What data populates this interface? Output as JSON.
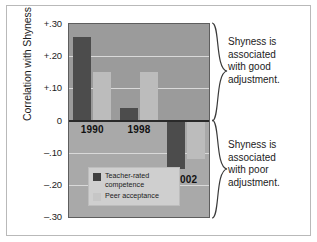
{
  "chart_data": {
    "type": "bar",
    "title": "",
    "xlabel": "",
    "ylabel": "Correlation with Shyness",
    "ylim": [
      -0.3,
      0.3
    ],
    "grid": true,
    "legend_position": "inside-bottom-left",
    "categories": [
      "1990",
      "1998",
      "2002"
    ],
    "ytick_labels": [
      "+.30",
      "+.20",
      "+.10",
      "0",
      "–.10",
      "–.20",
      "–.30"
    ],
    "ytick_values": [
      0.3,
      0.2,
      0.1,
      0,
      -0.1,
      -0.2,
      -0.3
    ],
    "series": [
      {
        "name": "Teacher-rated competence",
        "color": "#4c4c4c",
        "values": [
          0.26,
          0.04,
          -0.15
        ]
      },
      {
        "name": "Peer acceptance",
        "color": "#bcbcbc",
        "values": [
          0.15,
          0.15,
          -0.12
        ]
      }
    ],
    "annotations": [
      {
        "id": "good",
        "text": "Shyness is associated with good adjustment.",
        "range": [
          0,
          0.3
        ]
      },
      {
        "id": "poor",
        "text": "Shyness is associated with poor adjustment.",
        "range": [
          -0.3,
          0
        ]
      }
    ]
  },
  "axis": {
    "y_title": "Correlation with Shyness",
    "ticks": [
      {
        "label": "+.30",
        "value": 0.3
      },
      {
        "label": "+.20",
        "value": 0.2
      },
      {
        "label": "+.10",
        "value": 0.1
      },
      {
        "label": "0",
        "value": 0
      },
      {
        "label": "–.10",
        "value": -0.1
      },
      {
        "label": "–.20",
        "value": -0.2
      },
      {
        "label": "–.30",
        "value": -0.3
      }
    ]
  },
  "year_labels": [
    {
      "text": "1990",
      "value": 1990
    },
    {
      "text": "1998",
      "value": 1998
    },
    {
      "text": "2002",
      "value": 2002
    }
  ],
  "legend": {
    "items": [
      {
        "label_line1": "Teacher-rated",
        "label_line2": "competence",
        "color": "#3f3f3f"
      },
      {
        "label_line1": "Peer acceptance",
        "label_line2": "",
        "color": "#c6c6c6"
      }
    ]
  },
  "annotations": {
    "good": {
      "line1": "Shyness is",
      "line2": "associated",
      "line3": "with good",
      "line4": "adjustment."
    },
    "poor": {
      "line1": "Shyness is",
      "line2": "associated",
      "line3": "with poor",
      "line4": "adjustment."
    }
  },
  "colors": {
    "plot_background": "#9b9b9b",
    "plot_background_lower": "#a9a9a9",
    "gridline": "#d9d9d9",
    "zero_line": "#2a2a2a",
    "dark_series": "#4c4c4c",
    "light_series": "#bcbcbc",
    "legend_background": "#cfcfcf",
    "text": "#1c1c1c"
  }
}
